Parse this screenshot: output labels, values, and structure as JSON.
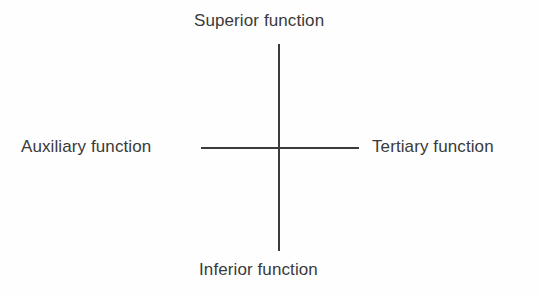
{
  "diagram": {
    "type": "axis-cross",
    "title": "",
    "background_color": "#fefefe",
    "line_color": "#3b3b3b",
    "text_color": "#3a3a3a",
    "axes": {
      "vertical": {
        "name": "vertical-axis",
        "top_label": "Superior function",
        "bottom_label": "Inferior function"
      },
      "horizontal": {
        "name": "horizontal-axis",
        "left_label": "Auxiliary function",
        "right_label": "Tertiary function"
      }
    },
    "labels": {
      "superior": "Superior function",
      "inferior": "Inferior function",
      "auxiliary": "Auxiliary function",
      "tertiary": "Tertiary function"
    }
  }
}
